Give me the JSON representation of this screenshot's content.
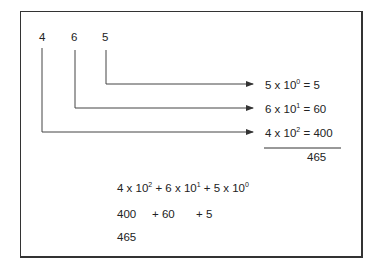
{
  "digits": [
    "4",
    "6",
    "5"
  ],
  "expansions": [
    {
      "coef": "5",
      "times": "x 10",
      "exp": "0",
      "result": "= 5"
    },
    {
      "coef": "6",
      "times": "x 10",
      "exp": "1",
      "result": "= 60"
    },
    {
      "coef": "4",
      "times": "x 10",
      "exp": "2",
      "result": "= 400"
    }
  ],
  "sum": "465",
  "bottom": {
    "line1": [
      {
        "base": "4 x 10",
        "exp": "2"
      },
      {
        "base": " + 6 x 10",
        "exp": "1"
      },
      {
        "base": " + 5 x 10",
        "exp": "0"
      }
    ],
    "line2": [
      "400",
      "+ 60",
      "+ 5"
    ],
    "line3": "465"
  }
}
